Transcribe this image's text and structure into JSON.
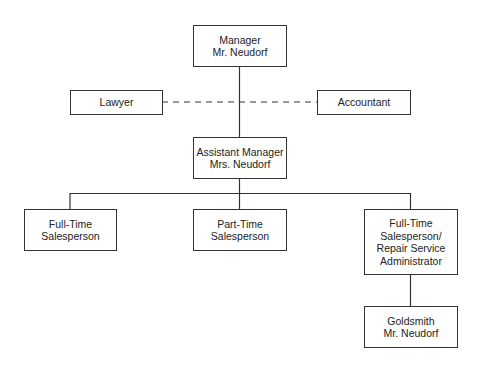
{
  "chart": {
    "type": "org-chart",
    "nodes": {
      "manager": {
        "lines": [
          "Manager",
          "Mr. Neudorf"
        ]
      },
      "lawyer": {
        "lines": [
          "Lawyer"
        ]
      },
      "accountant": {
        "lines": [
          "Accountant"
        ]
      },
      "assistant_manager": {
        "lines": [
          "Assistant Manager",
          "Mrs. Neudorf"
        ]
      },
      "full_time_salesperson": {
        "lines": [
          "Full-Time",
          "Salesperson"
        ]
      },
      "part_time_salesperson": {
        "lines": [
          "Part-Time",
          "Salesperson"
        ]
      },
      "full_time_repair": {
        "lines": [
          "Full-Time",
          "Salesperson/",
          "Repair Service",
          "Administrator"
        ]
      },
      "goldsmith": {
        "lines": [
          "Goldsmith",
          "Mr. Neudorf"
        ]
      }
    },
    "edges": [
      {
        "from": "manager",
        "to": "assistant_manager",
        "style": "solid"
      },
      {
        "from": "lawyer",
        "to": "accountant",
        "style": "dashed"
      },
      {
        "from": "assistant_manager",
        "to": "full_time_salesperson",
        "style": "solid"
      },
      {
        "from": "assistant_manager",
        "to": "part_time_salesperson",
        "style": "solid"
      },
      {
        "from": "assistant_manager",
        "to": "full_time_repair",
        "style": "solid"
      },
      {
        "from": "full_time_repair",
        "to": "goldsmith",
        "style": "solid"
      }
    ],
    "colors": {
      "line": "#333333",
      "text": "#222222",
      "background": "#ffffff"
    }
  }
}
